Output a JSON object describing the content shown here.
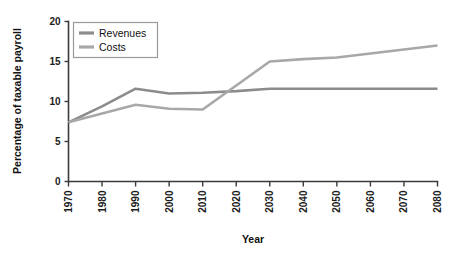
{
  "chart_data": {
    "type": "line",
    "title": "",
    "xlabel": "Year",
    "ylabel": "Percentage of taxable payroll",
    "xlim": [
      1970,
      2080
    ],
    "ylim": [
      0,
      20
    ],
    "xticks": [
      "1970",
      "1980",
      "1990",
      "2000",
      "2010",
      "2020",
      "2030",
      "2040",
      "2050",
      "2060",
      "2070",
      "2080"
    ],
    "yticks": [
      "0",
      "5",
      "10",
      "15",
      "20"
    ],
    "grid": false,
    "legend_position": "top-left",
    "x": [
      1970,
      1980,
      1990,
      2000,
      2010,
      2020,
      2030,
      2040,
      2050,
      2060,
      2070,
      2080
    ],
    "series": [
      {
        "name": "Revenues",
        "color": "#8c8c8c",
        "values": [
          7.4,
          9.4,
          11.6,
          11.0,
          11.1,
          11.3,
          11.6,
          11.6,
          11.6,
          11.6,
          11.6,
          11.6
        ]
      },
      {
        "name": "Costs",
        "color": "#a8a8a8",
        "values": [
          7.4,
          8.5,
          9.6,
          9.1,
          9.0,
          12.0,
          15.0,
          15.3,
          15.5,
          16.0,
          16.5,
          17.0
        ]
      }
    ]
  },
  "legend": {
    "items": [
      {
        "label": "Revenues"
      },
      {
        "label": "Costs"
      }
    ]
  },
  "axes": {
    "x_title": "Year",
    "y_title": "Percentage of taxable payroll"
  },
  "colors": {
    "axis": "#3b3b3b",
    "text": "#111111",
    "revenues": "#8c8c8c",
    "costs": "#a8a8a8",
    "background": "#ffffff"
  }
}
